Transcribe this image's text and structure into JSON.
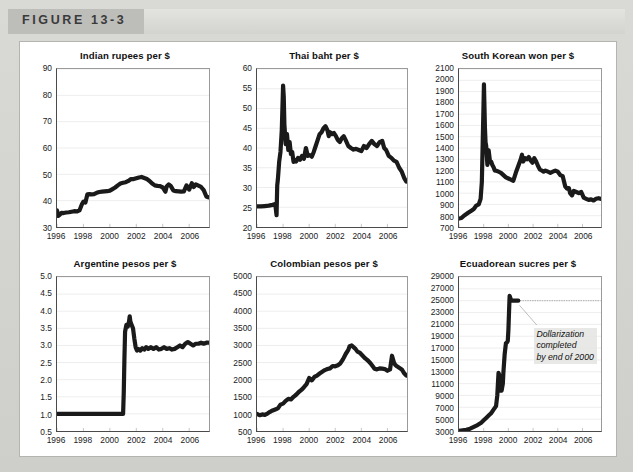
{
  "figure": {
    "label": "FIGURE 13-3",
    "accent_tab_color": "#bdbdba",
    "band_color": "#dcdcd9",
    "panel_background": "#ffffff"
  },
  "chart_data": [
    {
      "id": "indian-rupees",
      "type": "line",
      "title": "Indian rupees per $",
      "xlabel": "",
      "ylabel": "",
      "xlim": [
        1996,
        2007.5
      ],
      "ylim": [
        30,
        90
      ],
      "ytick_step": 10,
      "ytick_labels": [
        "30",
        "40",
        "50",
        "60",
        "70",
        "80",
        "90"
      ],
      "xtick_labels": [
        "1996",
        "1998",
        "2000",
        "2002",
        "2004",
        "2006"
      ],
      "xticks": [
        1996,
        1998,
        2000,
        2002,
        2004,
        2006
      ],
      "grid": true,
      "legend": "none",
      "x": [
        1996.0,
        1996.1,
        1996.2,
        1996.35,
        1996.5,
        1996.7,
        1996.9,
        1997.1,
        1997.3,
        1997.5,
        1997.7,
        1997.9,
        1998.0,
        1998.15,
        1998.3,
        1998.45,
        1998.6,
        1998.8,
        1999.0,
        1999.2,
        1999.4,
        1999.6,
        1999.8,
        2000.0,
        2000.2,
        2000.4,
        2000.6,
        2000.8,
        2001.0,
        2001.2,
        2001.4,
        2001.6,
        2001.8,
        2002.0,
        2002.2,
        2002.4,
        2002.6,
        2002.8,
        2003.0,
        2003.2,
        2003.4,
        2003.6,
        2003.8,
        2004.0,
        2004.2,
        2004.3,
        2004.45,
        2004.6,
        2004.8,
        2005.0,
        2005.2,
        2005.4,
        2005.6,
        2005.8,
        2006.0,
        2006.2,
        2006.35,
        2006.5,
        2006.7,
        2006.9,
        2007.1,
        2007.3,
        2007.45
      ],
      "values": [
        36.3,
        34.2,
        34.6,
        35.4,
        35.3,
        35.5,
        35.6,
        35.8,
        36.0,
        35.9,
        36.3,
        38.8,
        39.6,
        39.3,
        42.4,
        42.5,
        42.4,
        42.5,
        43.0,
        43.3,
        43.4,
        43.5,
        43.6,
        43.8,
        44.4,
        45.0,
        45.8,
        46.5,
        46.8,
        47.0,
        47.5,
        48.2,
        48.2,
        48.5,
        48.8,
        49.0,
        48.6,
        48.2,
        47.5,
        46.5,
        45.8,
        45.6,
        45.5,
        45.0,
        43.4,
        45.4,
        46.2,
        45.6,
        43.9,
        43.6,
        43.5,
        43.4,
        43.5,
        45.8,
        44.2,
        46.6,
        45.2,
        46.2,
        45.7,
        45.2,
        44.0,
        41.6,
        41.3
      ]
    },
    {
      "id": "thai-baht",
      "type": "line",
      "title": "Thai baht per $",
      "xlabel": "",
      "ylabel": "",
      "xlim": [
        1996,
        2007.5
      ],
      "ylim": [
        20,
        60
      ],
      "ytick_step": 5,
      "ytick_labels": [
        "20",
        "25",
        "30",
        "35",
        "40",
        "45",
        "50",
        "55",
        "60"
      ],
      "xtick_labels": [
        "1996",
        "1998",
        "2000",
        "2002",
        "2004",
        "2006"
      ],
      "xticks": [
        1996,
        1998,
        2000,
        2002,
        2004,
        2006
      ],
      "grid": true,
      "legend": "none",
      "x": [
        1996.0,
        1996.3,
        1996.6,
        1996.9,
        1997.2,
        1997.4,
        1997.5,
        1997.55,
        1997.6,
        1997.7,
        1997.8,
        1997.9,
        1998.0,
        1998.05,
        1998.1,
        1998.2,
        1998.3,
        1998.4,
        1998.5,
        1998.6,
        1998.7,
        1998.8,
        1998.9,
        1999.0,
        1999.15,
        1999.3,
        1999.45,
        1999.6,
        1999.75,
        1999.9,
        2000.05,
        2000.2,
        2000.35,
        2000.5,
        2000.65,
        2000.8,
        2000.95,
        2001.1,
        2001.25,
        2001.4,
        2001.5,
        2001.6,
        2001.75,
        2001.9,
        2002.05,
        2002.2,
        2002.35,
        2002.5,
        2002.65,
        2002.8,
        2003.0,
        2003.2,
        2003.4,
        2003.6,
        2003.8,
        2004.0,
        2004.2,
        2004.4,
        2004.6,
        2004.8,
        2005.0,
        2005.2,
        2005.4,
        2005.6,
        2005.75,
        2005.9,
        2006.1,
        2006.3,
        2006.5,
        2006.7,
        2006.9,
        2007.1,
        2007.3,
        2007.45
      ],
      "values": [
        25.2,
        25.2,
        25.3,
        25.4,
        25.6,
        25.8,
        23.0,
        30.5,
        32.0,
        36.5,
        39.0,
        44.5,
        55.8,
        53.0,
        46.0,
        41.0,
        43.5,
        39.5,
        41.5,
        38.5,
        39.0,
        36.5,
        37.0,
        36.6,
        37.5,
        37.0,
        38.0,
        37.3,
        40.0,
        38.0,
        38.2,
        37.8,
        39.0,
        40.5,
        42.0,
        43.5,
        44.0,
        45.0,
        45.5,
        44.5,
        43.0,
        44.0,
        43.5,
        43.8,
        43.0,
        42.0,
        41.5,
        42.5,
        43.0,
        42.0,
        40.5,
        40.0,
        39.6,
        39.8,
        39.5,
        39.2,
        40.5,
        40.0,
        41.0,
        41.8,
        41.0,
        40.5,
        41.5,
        41.8,
        40.0,
        39.5,
        38.0,
        37.5,
        36.8,
        36.5,
        35.0,
        34.0,
        32.3,
        31.5
      ]
    },
    {
      "id": "south-korean-won",
      "type": "line",
      "title": "South Korean won per $",
      "xlabel": "",
      "ylabel": "",
      "xlim": [
        1996,
        2007.5
      ],
      "ylim": [
        700,
        2100
      ],
      "ytick_step": 100,
      "ytick_labels": [
        "700",
        "800",
        "900",
        "1000",
        "1100",
        "1200",
        "1300",
        "1400",
        "1500",
        "1600",
        "1700",
        "1800",
        "1900",
        "2000",
        "2100"
      ],
      "xtick_labels": [
        "1996",
        "1998",
        "2000",
        "2002",
        "2004",
        "2006"
      ],
      "xticks": [
        1996,
        1998,
        2000,
        2002,
        2004,
        2006
      ],
      "grid": true,
      "legend": "none",
      "x": [
        1996.0,
        1996.2,
        1996.4,
        1996.6,
        1996.8,
        1997.0,
        1997.2,
        1997.4,
        1997.6,
        1997.75,
        1997.85,
        1997.92,
        1997.98,
        1998.02,
        1998.05,
        1998.1,
        1998.15,
        1998.2,
        1998.3,
        1998.4,
        1998.5,
        1998.6,
        1998.7,
        1998.8,
        1998.9,
        1999.0,
        1999.2,
        1999.4,
        1999.6,
        1999.8,
        2000.0,
        2000.2,
        2000.4,
        2000.6,
        2000.8,
        2001.0,
        2001.1,
        2001.2,
        2001.35,
        2001.5,
        2001.65,
        2001.8,
        2001.95,
        2002.1,
        2002.25,
        2002.4,
        2002.55,
        2002.7,
        2002.85,
        2003.0,
        2003.2,
        2003.4,
        2003.6,
        2003.8,
        2004.0,
        2004.2,
        2004.4,
        2004.6,
        2004.75,
        2004.9,
        2005.0,
        2005.15,
        2005.3,
        2005.5,
        2005.7,
        2005.9,
        2006.1,
        2006.3,
        2006.5,
        2006.7,
        2006.9,
        2007.1,
        2007.3,
        2007.45
      ],
      "values": [
        775,
        780,
        800,
        815,
        830,
        845,
        860,
        890,
        900,
        950,
        1100,
        1450,
        1750,
        1965,
        1820,
        1580,
        1450,
        1420,
        1250,
        1380,
        1290,
        1280,
        1250,
        1230,
        1200,
        1200,
        1190,
        1180,
        1160,
        1140,
        1130,
        1120,
        1110,
        1180,
        1240,
        1300,
        1340,
        1280,
        1310,
        1300,
        1320,
        1290,
        1270,
        1310,
        1280,
        1240,
        1210,
        1200,
        1190,
        1200,
        1190,
        1180,
        1190,
        1200,
        1190,
        1160,
        1150,
        1060,
        1040,
        1045,
        1000,
        980,
        1020,
        1010,
        1000,
        1010,
        960,
        950,
        940,
        945,
        935,
        950,
        955,
        950
      ]
    },
    {
      "id": "argentine-pesos",
      "type": "line",
      "title": "Argentine pesos per $",
      "xlabel": "",
      "ylabel": "",
      "xlim": [
        1996,
        2007.5
      ],
      "ylim": [
        0.5,
        5.0
      ],
      "ytick_step": 0.5,
      "ytick_labels": [
        "0.5",
        "1.0",
        "1.5",
        "2.0",
        "2.5",
        "3.0",
        "3.5",
        "4.0",
        "4.5",
        "5.0"
      ],
      "xtick_labels": [
        "1996",
        "1998",
        "2000",
        "2002",
        "2004",
        "2006"
      ],
      "xticks": [
        1996,
        1998,
        2000,
        2002,
        2004,
        2006
      ],
      "grid": true,
      "legend": "none",
      "x": [
        1996.0,
        1997.0,
        1998.0,
        1999.0,
        2000.0,
        2000.8,
        2001.0,
        2001.05,
        2001.1,
        2001.15,
        2001.25,
        2001.35,
        2001.45,
        2001.5,
        2001.55,
        2001.65,
        2001.75,
        2001.85,
        2001.95,
        2002.05,
        2002.15,
        2002.3,
        2002.45,
        2002.6,
        2002.75,
        2002.9,
        2003.1,
        2003.3,
        2003.5,
        2003.7,
        2003.9,
        2004.1,
        2004.3,
        2004.5,
        2004.7,
        2004.9,
        2005.1,
        2005.3,
        2005.5,
        2005.7,
        2005.9,
        2006.1,
        2006.3,
        2006.5,
        2006.7,
        2006.9,
        2007.1,
        2007.3,
        2007.45
      ],
      "values": [
        1.0,
        1.0,
        1.0,
        1.0,
        1.0,
        1.0,
        1.0,
        1.6,
        2.6,
        3.4,
        3.6,
        3.55,
        3.7,
        3.85,
        3.7,
        3.6,
        3.5,
        3.2,
        2.95,
        2.85,
        2.9,
        2.85,
        2.92,
        2.88,
        2.95,
        2.9,
        2.95,
        2.9,
        2.95,
        2.88,
        2.9,
        2.95,
        2.9,
        2.92,
        2.88,
        2.9,
        2.95,
        3.0,
        2.95,
        3.05,
        3.1,
        3.05,
        3.0,
        3.05,
        3.05,
        3.08,
        3.05,
        3.08,
        3.08
      ]
    },
    {
      "id": "colombian-pesos",
      "type": "line",
      "title": "Colombian pesos per $",
      "xlabel": "",
      "ylabel": "",
      "xlim": [
        1996,
        2007.5
      ],
      "ylim": [
        500,
        5000
      ],
      "ytick_step": 500,
      "ytick_labels": [
        "500",
        "1000",
        "1500",
        "2000",
        "2500",
        "3000",
        "3500",
        "4000",
        "4500",
        "5000"
      ],
      "xtick_labels": [
        "1996",
        "1998",
        "2000",
        "2002",
        "2004",
        "2006"
      ],
      "xticks": [
        1996,
        1998,
        2000,
        2002,
        2004,
        2006
      ],
      "grid": true,
      "legend": "none",
      "x": [
        1996.0,
        1996.2,
        1996.4,
        1996.6,
        1996.8,
        1997.0,
        1997.2,
        1997.4,
        1997.6,
        1997.8,
        1998.0,
        1998.2,
        1998.4,
        1998.6,
        1998.8,
        1999.0,
        1999.2,
        1999.4,
        1999.6,
        1999.8,
        2000.0,
        2000.2,
        2000.4,
        2000.6,
        2000.8,
        2001.0,
        2001.2,
        2001.4,
        2001.6,
        2001.8,
        2002.0,
        2002.2,
        2002.4,
        2002.6,
        2002.8,
        2003.0,
        2003.1,
        2003.25,
        2003.4,
        2003.55,
        2003.7,
        2003.9,
        2004.1,
        2004.3,
        2004.5,
        2004.7,
        2004.9,
        2005.0,
        2005.2,
        2005.4,
        2005.6,
        2005.8,
        2006.0,
        2006.2,
        2006.35,
        2006.5,
        2006.6,
        2006.7,
        2006.9,
        2007.1,
        2007.3,
        2007.45
      ],
      "values": [
        1000,
        960,
        985,
        970,
        1010,
        1060,
        1100,
        1130,
        1160,
        1270,
        1300,
        1380,
        1440,
        1420,
        1500,
        1560,
        1640,
        1700,
        1780,
        1870,
        2050,
        1980,
        2080,
        2120,
        2180,
        2230,
        2280,
        2310,
        2330,
        2400,
        2390,
        2420,
        2480,
        2600,
        2750,
        2870,
        2980,
        3000,
        2950,
        2900,
        2820,
        2780,
        2700,
        2620,
        2560,
        2480,
        2380,
        2320,
        2300,
        2330,
        2320,
        2310,
        2260,
        2300,
        2700,
        2500,
        2430,
        2400,
        2350,
        2300,
        2180,
        2120
      ]
    },
    {
      "id": "ecuadorean-sucres",
      "type": "line",
      "title": "Ecuadorean sucres per $",
      "xlabel": "",
      "ylabel": "",
      "xlim": [
        1996,
        2007.5
      ],
      "ylim": [
        3000,
        29000
      ],
      "ytick_step": 2000,
      "ytick_labels": [
        "3000",
        "5000",
        "7000",
        "9000",
        "11000",
        "13000",
        "15000",
        "17000",
        "19000",
        "21000",
        "23000",
        "25000",
        "27000",
        "29000"
      ],
      "xtick_labels": [
        "1996",
        "1998",
        "2000",
        "2002",
        "2004",
        "2006"
      ],
      "xticks": [
        1996,
        1998,
        2000,
        2002,
        2004,
        2006
      ],
      "grid": true,
      "legend": "none",
      "annotation": {
        "lines": [
          "Dollarization",
          "completed",
          "by end of 2000"
        ],
        "peg_level": 25000
      },
      "x": [
        1996.0,
        1996.3,
        1996.6,
        1996.9,
        1997.2,
        1997.5,
        1997.8,
        1998.0,
        1998.2,
        1998.4,
        1998.6,
        1998.8,
        1999.0,
        1999.1,
        1999.2,
        1999.25,
        1999.3,
        1999.35,
        1999.4,
        1999.45,
        1999.5,
        1999.55,
        1999.6,
        1999.65,
        1999.7,
        1999.8,
        1999.9,
        1999.95,
        2000.0,
        2000.05,
        2000.1,
        2000.2,
        2000.3,
        2000.5,
        2000.8
      ],
      "values": [
        3000,
        3100,
        3200,
        3400,
        3700,
        4000,
        4400,
        4800,
        5200,
        5600,
        6000,
        6600,
        7200,
        9000,
        12800,
        12500,
        9800,
        10000,
        10200,
        9800,
        10400,
        11000,
        13000,
        14500,
        16000,
        17800,
        18000,
        18200,
        20000,
        23000,
        25800,
        25200,
        25000,
        25000,
        25000
      ],
      "peg_x_start": 2000.8,
      "peg_x_end": 2007.45
    }
  ]
}
